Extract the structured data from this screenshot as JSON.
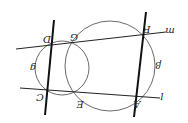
{
  "diagram": {
    "orientation": "rotated 180 degrees",
    "points": {
      "D": "D",
      "G": "G",
      "F": "F",
      "C": "C",
      "E": "E",
      "A": "A"
    },
    "lines": {
      "m": "m",
      "l": "l"
    },
    "circles": {
      "small": "g",
      "large": "β"
    },
    "colors": {
      "stroke": "#222222",
      "background": "#ffffff"
    }
  }
}
